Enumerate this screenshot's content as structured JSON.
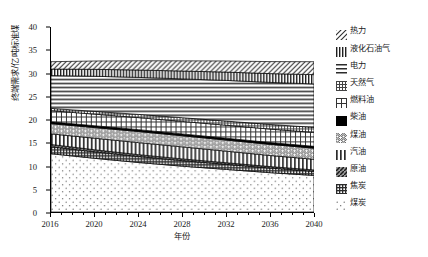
{
  "chart_data": {
    "type": "area",
    "stacked": true,
    "title": "",
    "xlabel": "年份",
    "ylabel": "终端需求/亿吨标准煤",
    "xlim": [
      2016,
      2040
    ],
    "ylim": [
      0,
      40
    ],
    "ytick_labels": [
      "0",
      "5",
      "10",
      "15",
      "20",
      "25",
      "30",
      "35",
      "40"
    ],
    "ytick_values": [
      0,
      5,
      10,
      15,
      20,
      25,
      30,
      35,
      40
    ],
    "xtick_labels": [
      "2016",
      "2020",
      "2024",
      "2028",
      "2032",
      "2036",
      "2040"
    ],
    "xtick_values": [
      2016,
      2020,
      2024,
      2028,
      2032,
      2036,
      2040
    ],
    "x": [
      2016,
      2020,
      2024,
      2028,
      2032,
      2036,
      2040
    ],
    "grid": false,
    "legend_position": "right",
    "series": [
      {
        "name": "煤炭",
        "pattern": "sparse-dots",
        "values": [
          12.6,
          11.6,
          10.7,
          9.9,
          9.2,
          8.5,
          7.9
        ]
      },
      {
        "name": "焦炭",
        "pattern": "dense-grid",
        "values": [
          1.5,
          1.4,
          1.3,
          1.2,
          1.1,
          1.0,
          0.9
        ]
      },
      {
        "name": "原油",
        "pattern": "diagonal-dark",
        "values": [
          0.5,
          0.45,
          0.4,
          0.38,
          0.35,
          0.32,
          0.3
        ]
      },
      {
        "name": "汽油",
        "pattern": "vertical-lines",
        "values": [
          2.3,
          2.5,
          2.6,
          2.6,
          2.5,
          2.4,
          2.3
        ]
      },
      {
        "name": "煤油",
        "pattern": "wavy-diagonal",
        "values": [
          2.2,
          2.3,
          2.4,
          2.4,
          2.4,
          2.4,
          2.4
        ]
      },
      {
        "name": "柴油",
        "pattern": "solid-black",
        "values": [
          0.4,
          0.4,
          0.4,
          0.4,
          0.4,
          0.4,
          0.4
        ]
      },
      {
        "name": "燃料油",
        "pattern": "cross-grid",
        "values": [
          2.4,
          2.5,
          2.6,
          2.7,
          2.8,
          2.9,
          3.0
        ]
      },
      {
        "name": "天然气",
        "pattern": "fine-crosshatch",
        "values": [
          0.5,
          0.6,
          0.7,
          0.8,
          0.9,
          1.0,
          1.1
        ]
      },
      {
        "name": "电力",
        "pattern": "horizontal-lines",
        "values": [
          7.1,
          7.6,
          8.0,
          8.4,
          8.8,
          9.1,
          9.4
        ]
      },
      {
        "name": "液化石油气",
        "pattern": "vert-ticks",
        "values": [
          1.4,
          1.5,
          1.6,
          1.7,
          1.8,
          1.9,
          2.0
        ]
      },
      {
        "name": "热力",
        "pattern": "diagonal-hatch",
        "values": [
          1.6,
          1.8,
          2.0,
          2.2,
          2.4,
          2.6,
          2.8
        ]
      }
    ],
    "legend_entries": [
      {
        "label": "热力",
        "pattern": "diagonal-hatch"
      },
      {
        "label": "液化石油气",
        "pattern": "vert-ticks"
      },
      {
        "label": "电力",
        "pattern": "horizontal-lines"
      },
      {
        "label": "天然气",
        "pattern": "fine-crosshatch"
      },
      {
        "label": "燃料油",
        "pattern": "cross-grid"
      },
      {
        "label": "柴油",
        "pattern": "solid-black"
      },
      {
        "label": "煤油",
        "pattern": "wavy-diagonal"
      },
      {
        "label": "汽油",
        "pattern": "vertical-lines"
      },
      {
        "label": "原油",
        "pattern": "diagonal-dark"
      },
      {
        "label": "焦炭",
        "pattern": "dense-grid"
      },
      {
        "label": "煤炭",
        "pattern": "sparse-dots"
      }
    ]
  },
  "caption": ""
}
